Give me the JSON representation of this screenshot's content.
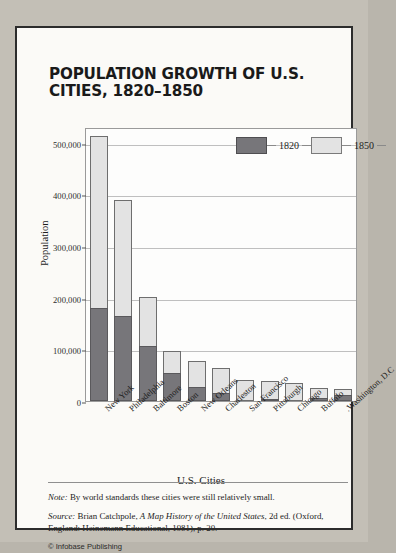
{
  "title": "POPULATION GROWTH OF U.S. CITIES, 1820–1850",
  "footer": {
    "note_label": "Note:",
    "note_text": " By world standards these cities were still relatively small.",
    "source_label": "Source:",
    "source_author": " Brian Catchpole, ",
    "source_work": "A Map History of the United States",
    "source_rest": ", 2d ed. (Oxford, England: Heinemann Educational, 1981), p. 20.",
    "credit": "© Infobase Publishing"
  },
  "chart_data": {
    "type": "bar",
    "subtype": "stacked",
    "title": "POPULATION GROWTH OF U.S. CITIES, 1820–1850",
    "xlabel": "U.S. Cities",
    "ylabel": "Population",
    "ylim": [
      0,
      530000
    ],
    "yticks": [
      "0",
      "100,000",
      "200,000",
      "300,000",
      "400,000",
      "500,000"
    ],
    "ytick_values": [
      0,
      100000,
      200000,
      300000,
      400000,
      500000
    ],
    "grid": true,
    "legend_position": "top-right",
    "categories": [
      "New York",
      "Philadelphia",
      "Baltimore",
      "Boston",
      "New Orleans",
      "Charleston",
      "San Francisco",
      "Pittsburgh",
      "Chicago",
      "Buffalo",
      "Washington, D.C."
    ],
    "series": [
      {
        "name": "1820",
        "color": "#77767a",
        "values": [
          180000,
          165000,
          107000,
          55000,
          28000,
          15000,
          0,
          4000,
          0,
          6000,
          11000
        ]
      },
      {
        "name": "1850",
        "color": "#e3e3e3",
        "values": [
          513000,
          389000,
          202000,
          97000,
          78000,
          63000,
          41000,
          39000,
          35000,
          25000,
          24000
        ]
      }
    ]
  }
}
